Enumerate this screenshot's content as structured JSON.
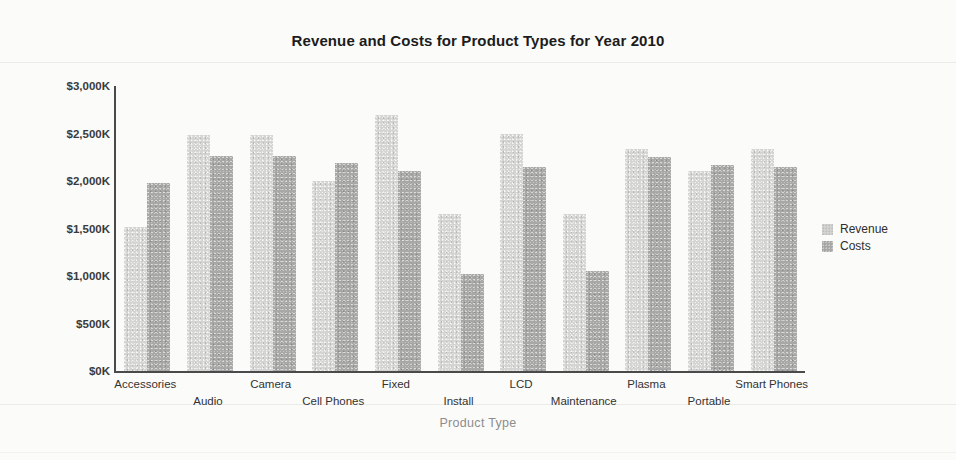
{
  "chart_data": {
    "type": "bar",
    "title": "Revenue and Costs for Product Types for Year 2010",
    "xlabel": "Product Type",
    "ylabel": "",
    "ylim": [
      0,
      3000
    ],
    "ytick_step": 500,
    "ytick_labels": [
      "$3,000K",
      "$2,500K",
      "$2,000K",
      "$1,500K",
      "$1,000K",
      "$500K",
      "$0K"
    ],
    "ytick_values": [
      3000,
      2500,
      2000,
      1500,
      1000,
      500,
      0
    ],
    "grid": false,
    "legend_position": "right",
    "categories": [
      "Accessories",
      "Audio",
      "Camera",
      "Cell Phones",
      "Fixed",
      "Install",
      "LCD",
      "Maintenance",
      "Plasma",
      "Portable",
      "Smart Phones"
    ],
    "series": [
      {
        "name": "Revenue",
        "color": "#d4d4d2",
        "values": [
          1520,
          2480,
          2480,
          2000,
          2700,
          1650,
          2500,
          1650,
          2340,
          2110,
          2340
        ]
      },
      {
        "name": "Costs",
        "color": "#a8a8a6",
        "values": [
          1980,
          2260,
          2260,
          2190,
          2110,
          1020,
          2150,
          1050,
          2250,
          2170,
          2150
        ]
      }
    ]
  }
}
